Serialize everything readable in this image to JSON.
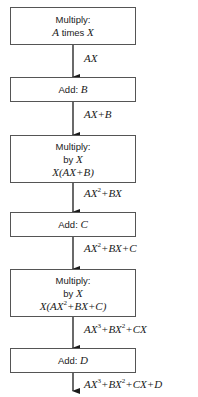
{
  "diagram": {
    "type": "flowchart",
    "title": "",
    "steps": [
      {
        "op": "Multiply:",
        "detail": "A times X",
        "expr": ""
      },
      {
        "op": "Add:",
        "detail": "B",
        "expr": ""
      },
      {
        "op": "Multiply:",
        "detail": "by X",
        "expr": "X(AX+B)"
      },
      {
        "op": "Add:",
        "detail": "C",
        "expr": ""
      },
      {
        "op": "Multiply:",
        "detail": "by X",
        "expr": "X(AX²+BX+C)"
      },
      {
        "op": "Add:",
        "detail": "D",
        "expr": ""
      }
    ],
    "edges": [
      {
        "label": "AX"
      },
      {
        "label": "AX+B"
      },
      {
        "label": "AX²+BX"
      },
      {
        "label": "AX²+BX+C"
      },
      {
        "label": "AX³+BX²+CX"
      },
      {
        "label": "AX³+BX²+CX+D"
      }
    ],
    "colors": {
      "line": "#1a1a1a",
      "box_border": "#555555",
      "background": "#ffffff"
    }
  }
}
